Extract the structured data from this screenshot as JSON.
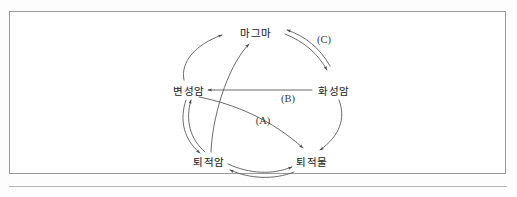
{
  "figure": {
    "frame": {
      "border_color": "#9a9a9a",
      "background": "#ffffff"
    }
  },
  "diagram": {
    "type": "cycle-diagram",
    "stroke_color": "#555555",
    "nodes": [
      {
        "id": "magma",
        "label": "마그마",
        "x": 256,
        "y": 32
      },
      {
        "id": "metamorphic-rock",
        "label": "변성암",
        "x": 189,
        "y": 90
      },
      {
        "id": "igneous-rock",
        "label": "화성암",
        "x": 334,
        "y": 90
      },
      {
        "id": "sedimentary-rock",
        "label": "퇴적암",
        "x": 209,
        "y": 161
      },
      {
        "id": "sediment",
        "label": "퇴적물",
        "x": 312,
        "y": 161
      }
    ],
    "step_labels": [
      {
        "id": "step-a",
        "label": "(A)",
        "x": 263,
        "y": 120
      },
      {
        "id": "step-b",
        "label": "(B)",
        "x": 288,
        "y": 98
      },
      {
        "id": "step-c",
        "label": "(C)",
        "x": 324,
        "y": 39
      }
    ],
    "edges": [
      {
        "id": "metamorphic-to-magma",
        "from": "변성암",
        "to": "마그마",
        "style": "curved",
        "direction": "one-way"
      },
      {
        "id": "sedimentary-to-magma",
        "from": "퇴적암",
        "to": "마그마",
        "style": "curved",
        "direction": "one-way"
      },
      {
        "id": "magma-igneous",
        "from": "마그마",
        "to": "화성암",
        "style": "double-arc",
        "direction": "two-way",
        "step": "(C)"
      },
      {
        "id": "igneous-to-metamorphic",
        "from": "화성암",
        "to": "변성암",
        "style": "straight",
        "direction": "one-way",
        "step": "(B)"
      },
      {
        "id": "metamorphic-to-sediment",
        "from": "변성암",
        "to": "퇴적물",
        "style": "curved",
        "direction": "one-way",
        "step": "(A)"
      },
      {
        "id": "igneous-to-sediment",
        "from": "화성암",
        "to": "퇴적물",
        "style": "curved",
        "direction": "one-way"
      },
      {
        "id": "metamorphic-sedimentary",
        "from": "변성암",
        "to": "퇴적암",
        "style": "double-arc",
        "direction": "two-way"
      },
      {
        "id": "sedimentary-sediment",
        "from": "퇴적암",
        "to": "퇴적물",
        "style": "double-arc",
        "direction": "two-way"
      }
    ]
  }
}
